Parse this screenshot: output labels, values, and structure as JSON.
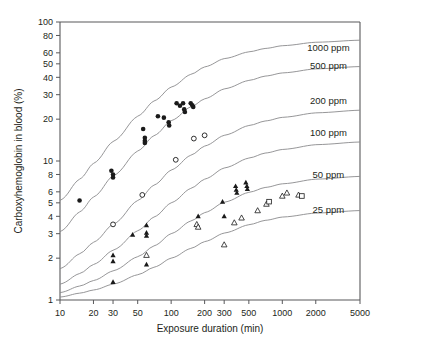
{
  "chart_data": {
    "type": "line",
    "title": "",
    "xlabel": "Exposure duration (min)",
    "ylabel": "Carboxyhemoglobin in blood (%)",
    "xscale": "log",
    "yscale": "log",
    "xlim": [
      10,
      5000
    ],
    "ylim": [
      1,
      100
    ],
    "grid": false,
    "legend_position": "right-inline-curve-labels",
    "xticks": [
      {
        "value": 10,
        "label": "10"
      },
      {
        "value": 20,
        "label": "20"
      },
      {
        "value": 30,
        "label": "30"
      },
      {
        "value": 50,
        "label": "50"
      },
      {
        "value": 100,
        "label": "100"
      },
      {
        "value": 200,
        "label": "200"
      },
      {
        "value": 300,
        "label": "300"
      },
      {
        "value": 500,
        "label": "500"
      },
      {
        "value": 1000,
        "label": "1000"
      },
      {
        "value": 2000,
        "label": "2000"
      },
      {
        "value": 5000,
        "label": "5000"
      }
    ],
    "yticks": [
      {
        "value": 1,
        "label": "1"
      },
      {
        "value": 2,
        "label": "2"
      },
      {
        "value": 3,
        "label": "3"
      },
      {
        "value": 4,
        "label": "4"
      },
      {
        "value": 5,
        "label": "5"
      },
      {
        "value": 6,
        "label": "6"
      },
      {
        "value": 8,
        "label": "8"
      },
      {
        "value": 10,
        "label": "10"
      },
      {
        "value": 20,
        "label": "20"
      },
      {
        "value": 30,
        "label": "30"
      },
      {
        "value": 40,
        "label": "40"
      },
      {
        "value": 50,
        "label": "50"
      },
      {
        "value": 60,
        "label": "60"
      },
      {
        "value": 80,
        "label": "80"
      },
      {
        "value": 100,
        "label": "100"
      }
    ],
    "series": [
      {
        "name": "1000 ppm",
        "label": "1000 ppm",
        "label_x": 2600,
        "label_y": 62,
        "curve": [
          [
            10,
            5.2
          ],
          [
            15,
            7.4
          ],
          [
            20,
            9.6
          ],
          [
            30,
            13.8
          ],
          [
            50,
            21.0
          ],
          [
            70,
            27.0
          ],
          [
            100,
            34.0
          ],
          [
            150,
            42.0
          ],
          [
            200,
            47.5
          ],
          [
            300,
            54.5
          ],
          [
            500,
            61.0
          ],
          [
            700,
            64.5
          ],
          [
            1000,
            67.5
          ],
          [
            2000,
            71.5
          ],
          [
            5000,
            74.0
          ]
        ]
      },
      {
        "name": "500 ppm",
        "label": "500 ppm",
        "label_x": 2600,
        "label_y": 46,
        "curve": [
          [
            10,
            3.1
          ],
          [
            15,
            4.3
          ],
          [
            20,
            5.5
          ],
          [
            30,
            7.8
          ],
          [
            50,
            11.8
          ],
          [
            70,
            15.2
          ],
          [
            100,
            19.5
          ],
          [
            150,
            24.5
          ],
          [
            200,
            28.0
          ],
          [
            300,
            33.0
          ],
          [
            500,
            38.0
          ],
          [
            700,
            40.8
          ],
          [
            1000,
            43.0
          ],
          [
            2000,
            46.0
          ],
          [
            5000,
            47.8
          ]
        ]
      },
      {
        "name": "200 ppm",
        "label": "200 ppm",
        "label_x": 2600,
        "label_y": 25.5,
        "curve": [
          [
            10,
            1.68
          ],
          [
            15,
            2.15
          ],
          [
            20,
            2.6
          ],
          [
            30,
            3.5
          ],
          [
            50,
            5.2
          ],
          [
            70,
            6.7
          ],
          [
            100,
            8.6
          ],
          [
            150,
            11.0
          ],
          [
            200,
            12.8
          ],
          [
            300,
            15.3
          ],
          [
            500,
            18.0
          ],
          [
            700,
            19.4
          ],
          [
            1000,
            20.6
          ],
          [
            2000,
            22.2
          ],
          [
            5000,
            23.2
          ]
        ]
      },
      {
        "name": "100 ppm",
        "label": "100 ppm",
        "label_x": 2600,
        "label_y": 15.2,
        "curve": [
          [
            10,
            1.3
          ],
          [
            15,
            1.55
          ],
          [
            20,
            1.8
          ],
          [
            30,
            2.28
          ],
          [
            50,
            3.15
          ],
          [
            70,
            3.95
          ],
          [
            100,
            5.0
          ],
          [
            150,
            6.35
          ],
          [
            200,
            7.4
          ],
          [
            300,
            8.9
          ],
          [
            500,
            10.5
          ],
          [
            700,
            11.4
          ],
          [
            1000,
            12.1
          ],
          [
            2000,
            13.1
          ],
          [
            5000,
            13.7
          ]
        ]
      },
      {
        "name": "50 ppm",
        "label": "50 ppm",
        "label_x": 2600,
        "label_y": 7.6,
        "curve": [
          [
            10,
            1.13
          ],
          [
            15,
            1.26
          ],
          [
            20,
            1.38
          ],
          [
            30,
            1.62
          ],
          [
            50,
            2.05
          ],
          [
            70,
            2.45
          ],
          [
            100,
            3.0
          ],
          [
            150,
            3.7
          ],
          [
            200,
            4.25
          ],
          [
            300,
            5.05
          ],
          [
            500,
            5.95
          ],
          [
            700,
            6.45
          ],
          [
            1000,
            6.85
          ],
          [
            2000,
            7.4
          ],
          [
            5000,
            7.75
          ]
        ]
      },
      {
        "name": "25 ppm",
        "label": "25 ppm",
        "label_x": 2600,
        "label_y": 4.2,
        "curve": [
          [
            10,
            1.05
          ],
          [
            15,
            1.12
          ],
          [
            20,
            1.18
          ],
          [
            30,
            1.3
          ],
          [
            50,
            1.52
          ],
          [
            70,
            1.72
          ],
          [
            100,
            2.0
          ],
          [
            150,
            2.35
          ],
          [
            200,
            2.63
          ],
          [
            300,
            3.03
          ],
          [
            500,
            3.48
          ],
          [
            700,
            3.74
          ],
          [
            1000,
            3.95
          ],
          [
            2000,
            4.22
          ],
          [
            5000,
            4.4
          ]
        ]
      }
    ],
    "scatter_groups": [
      {
        "name": "filled-circle",
        "marker": "filled-circle",
        "points": [
          [
            15,
            5.2
          ],
          [
            29,
            8.5
          ],
          [
            30,
            8.0
          ],
          [
            30,
            7.6
          ],
          [
            56,
            17.0
          ],
          [
            58,
            14.7
          ],
          [
            58,
            14.0
          ],
          [
            58,
            13.5
          ],
          [
            86,
            20.5
          ],
          [
            95,
            19.0
          ],
          [
            96,
            18.0
          ],
          [
            76,
            21.0
          ],
          [
            120,
            25.0
          ],
          [
            128,
            26.0
          ],
          [
            131,
            23.5
          ],
          [
            133,
            22.5
          ],
          [
            150,
            26.0
          ],
          [
            155,
            25.2
          ],
          [
            158,
            24.5
          ],
          [
            112,
            26.0
          ]
        ]
      },
      {
        "name": "open-circle",
        "marker": "open-circle",
        "points": [
          [
            30,
            3.5
          ],
          [
            55,
            5.7
          ],
          [
            110,
            10.2
          ],
          [
            160,
            14.5
          ],
          [
            200,
            15.3
          ]
        ]
      },
      {
        "name": "filled-triangle",
        "marker": "filled-triangle",
        "points": [
          [
            30,
            2.1
          ],
          [
            30,
            1.9
          ],
          [
            30,
            1.35
          ],
          [
            45,
            2.95
          ],
          [
            60,
            3.45
          ],
          [
            60,
            3.05
          ],
          [
            60,
            2.9
          ],
          [
            60,
            1.8
          ],
          [
            175,
            4.0
          ],
          [
            290,
            5.1
          ],
          [
            300,
            4.0
          ],
          [
            380,
            6.6
          ],
          [
            385,
            6.2
          ],
          [
            390,
            5.9
          ],
          [
            470,
            7.0
          ],
          [
            480,
            6.6
          ],
          [
            485,
            6.3
          ]
        ]
      },
      {
        "name": "open-triangle",
        "marker": "open-triangle",
        "points": [
          [
            60,
            2.1
          ],
          [
            170,
            3.5
          ],
          [
            175,
            3.35
          ],
          [
            300,
            2.5
          ],
          [
            370,
            3.6
          ],
          [
            430,
            3.9
          ],
          [
            600,
            4.4
          ],
          [
            720,
            4.9
          ],
          [
            1000,
            5.6
          ],
          [
            1100,
            5.9
          ],
          [
            1400,
            5.7
          ]
        ]
      },
      {
        "name": "open-square",
        "marker": "open-square",
        "points": [
          [
            760,
            5.1
          ],
          [
            1500,
            5.6
          ]
        ]
      }
    ]
  },
  "axes": {
    "x_title": "Exposure duration (min)",
    "y_title": "Carboxyhemoglobin in blood (%)"
  }
}
